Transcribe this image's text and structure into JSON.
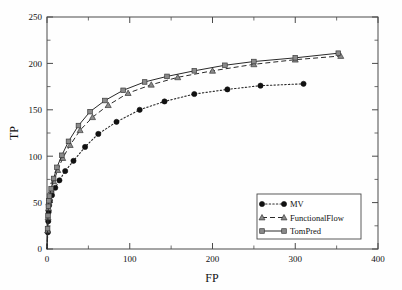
{
  "chart_data": {
    "type": "line",
    "title": "",
    "xlabel": "FP",
    "ylabel": "TP",
    "xlim": [
      0,
      400
    ],
    "ylim": [
      0,
      250
    ],
    "xticks": [
      0,
      100,
      200,
      300,
      400
    ],
    "yticks": [
      0,
      50,
      100,
      150,
      200,
      250
    ],
    "xtick_labels": [
      "0",
      "100",
      "200",
      "300",
      "400"
    ],
    "ytick_labels": [
      "0",
      "50",
      "100",
      "150",
      "200",
      "250"
    ],
    "x_minor_step": 50,
    "y_minor_step": 25,
    "grid": false,
    "legend_position": "lower right",
    "series": [
      {
        "name": "MV",
        "marker": "filled-circle",
        "linestyle": "dotted",
        "color": "#111111",
        "points": [
          [
            0,
            0
          ],
          [
            1,
            18
          ],
          [
            1.5,
            30
          ],
          [
            2,
            40
          ],
          [
            2.5,
            47
          ],
          [
            3.5,
            52
          ],
          [
            6,
            58
          ],
          [
            10,
            66
          ],
          [
            15,
            74
          ],
          [
            22,
            84
          ],
          [
            32,
            95
          ],
          [
            46,
            110
          ],
          [
            62,
            124
          ],
          [
            84,
            137
          ],
          [
            112,
            150
          ],
          [
            142,
            159
          ],
          [
            178,
            167
          ],
          [
            218,
            172
          ],
          [
            258,
            176
          ],
          [
            310,
            178
          ]
        ]
      },
      {
        "name": "FunctionalFlow",
        "marker": "triangle",
        "linestyle": "dashed",
        "color": "#2a2a2a",
        "points": [
          [
            0,
            0
          ],
          [
            0.8,
            20
          ],
          [
            1.3,
            34
          ],
          [
            1.8,
            44
          ],
          [
            2.3,
            50
          ],
          [
            3,
            55
          ],
          [
            5,
            63
          ],
          [
            8,
            73
          ],
          [
            13,
            85
          ],
          [
            19,
            98
          ],
          [
            28,
            112
          ],
          [
            40,
            128
          ],
          [
            55,
            142
          ],
          [
            74,
            155
          ],
          [
            98,
            168
          ],
          [
            126,
            177
          ],
          [
            158,
            185
          ],
          [
            200,
            192
          ],
          [
            250,
            199
          ],
          [
            300,
            204
          ],
          [
            355,
            208
          ]
        ]
      },
      {
        "name": "TomPred",
        "marker": "square",
        "linestyle": "solid",
        "color": "#2a2a2a",
        "points": [
          [
            0,
            0
          ],
          [
            0.7,
            22
          ],
          [
            1.2,
            36
          ],
          [
            1.7,
            46
          ],
          [
            2.2,
            52
          ],
          [
            3,
            57
          ],
          [
            5,
            65
          ],
          [
            8,
            76
          ],
          [
            12,
            88
          ],
          [
            18,
            101
          ],
          [
            26,
            116
          ],
          [
            38,
            133
          ],
          [
            52,
            148
          ],
          [
            70,
            160
          ],
          [
            92,
            171
          ],
          [
            118,
            180
          ],
          [
            145,
            186
          ],
          [
            178,
            192
          ],
          [
            215,
            198
          ],
          [
            250,
            202
          ],
          [
            300,
            206
          ],
          [
            352,
            211
          ]
        ]
      }
    ]
  },
  "legend": {
    "entries": [
      {
        "label": "MV",
        "key": "MV"
      },
      {
        "label": "FunctionalFlow",
        "key": "FunctionalFlow"
      },
      {
        "label": "TomPred",
        "key": "TomPred"
      }
    ]
  }
}
